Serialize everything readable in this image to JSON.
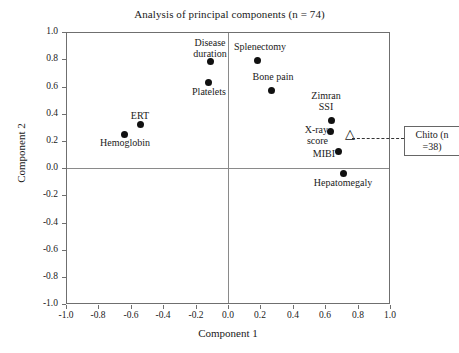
{
  "chart_data": {
    "type": "scatter",
    "title": "Analysis of principal components (n = 74)",
    "xlabel": "Component 1",
    "ylabel": "Component 2",
    "xlim": [
      -1.0,
      1.0
    ],
    "ylim": [
      -1.0,
      1.0
    ],
    "grid": false,
    "legend": "none",
    "xticks": [
      "-1.0",
      "-0.8",
      "-0.6",
      "-0.4",
      "-0.2",
      "0.0",
      "0.2",
      "0.4",
      "0.6",
      "0.8",
      "1.0"
    ],
    "xtickvals": [
      -1.0,
      -0.8,
      -0.6,
      -0.4,
      -0.2,
      0.0,
      0.2,
      0.4,
      0.6,
      0.8,
      1.0
    ],
    "yticks": [
      "1.0",
      "0.8",
      "0.6",
      "0.4",
      "0.2",
      "0.0",
      "-0.2",
      "-0.4",
      "-0.6",
      "-0.8",
      "-1.0"
    ],
    "ytickvals": [
      1.0,
      0.8,
      0.6,
      0.4,
      0.2,
      0.0,
      -0.2,
      -0.4,
      -0.6,
      -0.8,
      -1.0
    ],
    "points": [
      {
        "label": "Hemoglobin",
        "x": -0.64,
        "y": 0.25,
        "marker": "filled-circle",
        "label_pos": "below"
      },
      {
        "label": "ERT",
        "x": -0.54,
        "y": 0.32,
        "marker": "filled-circle",
        "label_pos": "above"
      },
      {
        "label": "Disease\nduration",
        "x": -0.11,
        "y": 0.78,
        "marker": "filled-circle",
        "label_pos": "above"
      },
      {
        "label": "Platelets",
        "x": -0.12,
        "y": 0.63,
        "marker": "filled-circle",
        "label_pos": "below"
      },
      {
        "label": "Splenectomy",
        "x": 0.185,
        "y": 0.79,
        "marker": "filled-circle",
        "label_pos": "above"
      },
      {
        "label": "Bone pain",
        "x": 0.27,
        "y": 0.57,
        "marker": "filled-circle",
        "label_pos": "above"
      },
      {
        "label": "Zimran\nSSI",
        "x": 0.64,
        "y": 0.35,
        "marker": "filled-circle",
        "label_pos": "left-above"
      },
      {
        "label": "X-ray\nscore",
        "x": 0.63,
        "y": 0.27,
        "marker": "filled-circle",
        "label_pos": "left"
      },
      {
        "label": "MIBI",
        "x": 0.685,
        "y": 0.12,
        "marker": "filled-circle",
        "label_pos": "left"
      },
      {
        "label": "Hepatomegaly",
        "x": 0.71,
        "y": -0.04,
        "marker": "filled-circle",
        "label_pos": "below"
      },
      {
        "label": "",
        "x": 0.76,
        "y": 0.22,
        "marker": "open-triangle",
        "label_pos": "none"
      }
    ],
    "annotations": [
      {
        "name": "chito-callout",
        "text": "Chito\n(n =38)",
        "points_to": "open-triangle-marker",
        "style": "dashed-leader-boxed"
      }
    ]
  },
  "labels": {
    "hemoglobin": "Hemoglobin",
    "ert": "ERT",
    "disease_duration": "Disease\nduration",
    "platelets": "Platelets",
    "splenectomy": "Splenectomy",
    "bone_pain": "Bone pain",
    "zimran_ssi": "Zimran\nSSI",
    "xray_score": "X-ray\nscore",
    "mibi": "MIBI",
    "hepatomegaly": "Hepatomegaly",
    "chito_box": "Chito\n(n =38)"
  },
  "axis": {
    "x0": "-1.0",
    "x1": "-0.8",
    "x2": "-0.6",
    "x3": "-0.4",
    "x4": "-0.2",
    "x5": "0.0",
    "x6": "0.2",
    "x7": "0.4",
    "x8": "0.6",
    "x9": "0.8",
    "x10": "1.0",
    "y0": "1.0",
    "y1": "0.8",
    "y2": "0.6",
    "y3": "0.4",
    "y4": "0.2",
    "y5": "0.0",
    "y6": "-0.2",
    "y7": "-0.4",
    "y8": "-0.6",
    "y9": "-0.8",
    "y10": "-1.0"
  },
  "colors": {
    "marker": "#111111",
    "frame": "#6f6f6f",
    "text": "#1a1a1a"
  }
}
